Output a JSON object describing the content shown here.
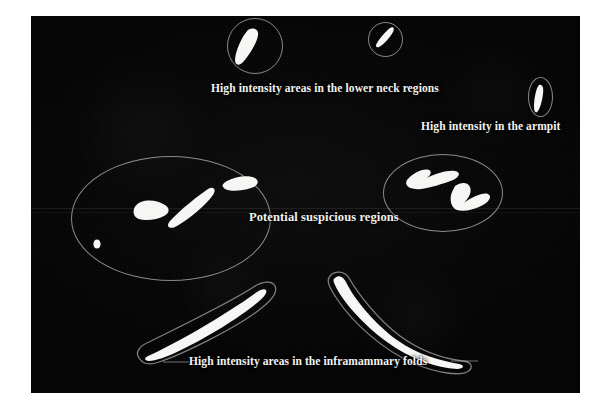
{
  "figure": {
    "domain": "medical-thermogram-annotation",
    "canvas": {
      "background_color": "#060606",
      "outline_color": "#d8d8d8",
      "hotspot_color": "#f6f6f4",
      "text_color": "#f2f2f0"
    },
    "annotations": [
      {
        "id": "lower-neck",
        "label": "High intensity areas in the lower neck regions",
        "marker_shape": "circle",
        "marker_count": 2
      },
      {
        "id": "armpit",
        "label": "High intensity in the armpit",
        "marker_shape": "ellipse",
        "marker_count": 1
      },
      {
        "id": "suspicious",
        "label": "Potential suspicious regions",
        "marker_shape": "ellipse",
        "marker_count": 2
      },
      {
        "id": "inframammary",
        "label": "High intensity areas in the inframammary folds",
        "marker_shape": "contour",
        "marker_count": 2
      }
    ],
    "labels": {
      "lower_neck": "High intensity areas in the lower neck regions",
      "armpit": "High intensity in the armpit",
      "suspicious": "Potential suspicious regions",
      "inframammary": "High intensity areas in the inframammary folds"
    }
  }
}
